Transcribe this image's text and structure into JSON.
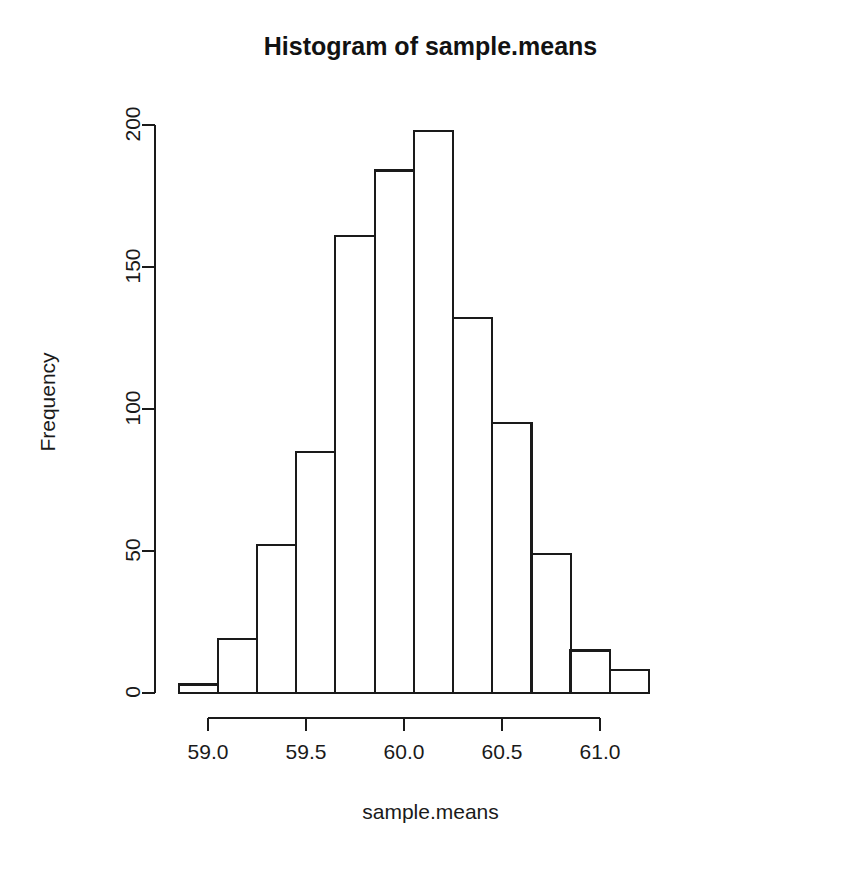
{
  "chart_data": {
    "type": "bar",
    "subtype": "histogram",
    "title": "Histogram of sample.means",
    "xlabel": "sample.means",
    "ylabel": "Frequency",
    "grid": false,
    "legend": false,
    "legend_position": "none",
    "xlim": [
      58.83,
      61.22
    ],
    "ylim": [
      0,
      200
    ],
    "xticks": [
      59.0,
      59.5,
      60.0,
      60.5,
      61.0
    ],
    "xtick_labels": [
      "59.0",
      "59.5",
      "60.0",
      "60.5",
      "61.0"
    ],
    "yticks": [
      0,
      50,
      100,
      150,
      200
    ],
    "ytick_labels": [
      "0",
      "50",
      "100",
      "150",
      "200"
    ],
    "bin_width": 0.2,
    "bin_edges": [
      58.85,
      59.05,
      59.25,
      59.45,
      59.65,
      59.85,
      60.05,
      60.25,
      60.45,
      60.65,
      60.85,
      61.05,
      61.25
    ],
    "categories": [
      "58.85-59.05",
      "59.05-59.25",
      "59.25-59.45",
      "59.45-59.65",
      "59.65-59.85",
      "59.85-60.05",
      "60.05-60.25",
      "60.25-60.45",
      "60.45-60.65",
      "60.65-60.85",
      "60.85-61.05",
      "61.05-61.25"
    ],
    "values": [
      3,
      19,
      52,
      85,
      161,
      184,
      198,
      132,
      95,
      49,
      15,
      8
    ],
    "bar_fill": "#ffffff",
    "bar_stroke": "#1a1a1a",
    "axis_color": "#1a1a1a"
  },
  "axis": {
    "y_tick_0": "0",
    "y_tick_1": "50",
    "y_tick_2": "100",
    "y_tick_3": "150",
    "y_tick_4": "200",
    "x_tick_0": "59.0",
    "x_tick_1": "59.5",
    "x_tick_2": "60.0",
    "x_tick_3": "60.5",
    "x_tick_4": "61.0"
  },
  "labels": {
    "title": "Histogram of sample.means",
    "xlabel": "sample.means",
    "ylabel": "Frequency"
  }
}
